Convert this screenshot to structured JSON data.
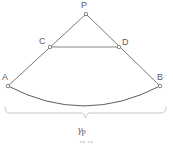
{
  "figure": {
    "stroke_color": "#6b6b6b",
    "arc_color": "#5f5f5f",
    "brace_color": "#b9b9b9",
    "label_color": "#5c5c5c",
    "background_color": "#ffffff",
    "vertices": [
      {
        "id": "P",
        "label": "P",
        "x": 86,
        "y": 14,
        "label_x": 81,
        "label_y": 2
      },
      {
        "id": "C",
        "label": "C",
        "x": 50,
        "y": 47,
        "label_x": 39,
        "label_y": 38
      },
      {
        "id": "D",
        "label": "D",
        "x": 119,
        "y": 47,
        "label_x": 122,
        "label_y": 39
      },
      {
        "id": "A",
        "label": "A",
        "x": 8,
        "y": 86,
        "label_x": 2,
        "label_y": 74
      },
      {
        "id": "B",
        "label": "B",
        "x": 160,
        "y": 86,
        "label_x": 158,
        "label_y": 74
      }
    ],
    "segments": [
      {
        "from": "A",
        "to": "P"
      },
      {
        "from": "P",
        "to": "B"
      },
      {
        "from": "C",
        "to": "D"
      }
    ],
    "arc": {
      "from": "A",
      "to": "B",
      "sag_y": 106,
      "description": "concave-up circular arc from A to B"
    },
    "brace": {
      "left_x": 5,
      "right_x": 166,
      "y": 111,
      "label_symbol": "γ",
      "label_subscript": "P"
    },
    "caption_partial": "••    ••"
  }
}
